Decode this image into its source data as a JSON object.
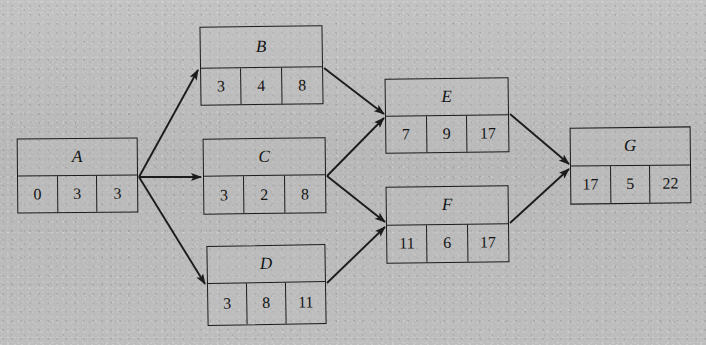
{
  "figure": {
    "type": "activity-on-node-network-diagram",
    "background_color": "#bdbdbd",
    "line_color": "#1c1c1c"
  },
  "nodes": [
    {
      "id": "A",
      "label": "A",
      "cells": [
        "0",
        "3",
        "3"
      ]
    },
    {
      "id": "B",
      "label": "B",
      "cells": [
        "3",
        "4",
        "8"
      ]
    },
    {
      "id": "C",
      "label": "C",
      "cells": [
        "3",
        "2",
        "8"
      ]
    },
    {
      "id": "D",
      "label": "D",
      "cells": [
        "3",
        "8",
        "11"
      ]
    },
    {
      "id": "E",
      "label": "E",
      "cells": [
        "7",
        "9",
        "17"
      ]
    },
    {
      "id": "F",
      "label": "F",
      "cells": [
        "11",
        "6",
        "17"
      ]
    },
    {
      "id": "G",
      "label": "G",
      "cells": [
        "17",
        "5",
        "22"
      ]
    }
  ],
  "edges": [
    {
      "from": "A",
      "to": "B"
    },
    {
      "from": "A",
      "to": "C"
    },
    {
      "from": "A",
      "to": "D"
    },
    {
      "from": "B",
      "to": "E"
    },
    {
      "from": "C",
      "to": "E"
    },
    {
      "from": "C",
      "to": "F"
    },
    {
      "from": "D",
      "to": "F"
    },
    {
      "from": "E",
      "to": "G"
    },
    {
      "from": "F",
      "to": "G"
    }
  ]
}
